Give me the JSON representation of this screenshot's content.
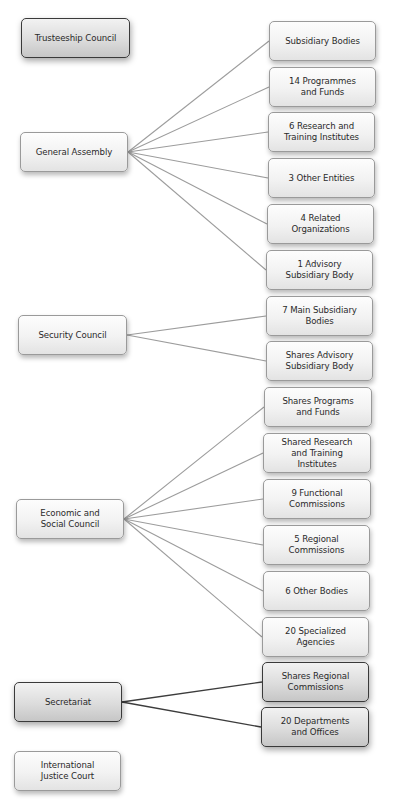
{
  "diagram": {
    "type": "org-chart",
    "left_nodes": [
      {
        "id": "trusteeship",
        "label": "Trusteeship Council",
        "x": 21,
        "y": 18,
        "w": 109,
        "style": "dark"
      },
      {
        "id": "general_assembly",
        "label": "General Assembly",
        "x": 20,
        "y": 132,
        "w": 108,
        "style": "light"
      },
      {
        "id": "security_council",
        "label": "Security Council",
        "x": 18,
        "y": 315,
        "w": 109,
        "style": "light"
      },
      {
        "id": "ecosoc",
        "label": "Economic and\nSocial Council",
        "x": 16,
        "y": 499,
        "w": 108,
        "style": "light"
      },
      {
        "id": "secretariat",
        "label": "Secretariat",
        "x": 14,
        "y": 682,
        "w": 108,
        "style": "dark"
      },
      {
        "id": "icj",
        "label": "International\nJustice Court",
        "x": 14,
        "y": 751,
        "w": 107,
        "style": "light"
      }
    ],
    "right_nodes": [
      {
        "id": "ga_1",
        "parent": "general_assembly",
        "label": "Subsidiary Bodies",
        "x": 269,
        "y": 21,
        "w": 107,
        "style": "light"
      },
      {
        "id": "ga_2",
        "parent": "general_assembly",
        "label": "14 Programmes\nand Funds",
        "x": 269,
        "y": 67,
        "w": 107,
        "style": "light"
      },
      {
        "id": "ga_3",
        "parent": "general_assembly",
        "label": "6 Research and\nTraining Institutes",
        "x": 268,
        "y": 112,
        "w": 107,
        "style": "light"
      },
      {
        "id": "ga_4",
        "parent": "general_assembly",
        "label": "3 Other Entities",
        "x": 268,
        "y": 158,
        "w": 107,
        "style": "light"
      },
      {
        "id": "ga_5",
        "parent": "general_assembly",
        "label": "4 Related\nOrganizations",
        "x": 267,
        "y": 204,
        "w": 107,
        "style": "light"
      },
      {
        "id": "ga_6",
        "parent": "general_assembly",
        "label": "1 Advisory\nSubsidiary Body",
        "x": 266,
        "y": 250,
        "w": 107,
        "style": "light"
      },
      {
        "id": "sc_1",
        "parent": "security_council",
        "label": "7 Main Subsidiary\nBodies",
        "x": 266,
        "y": 296,
        "w": 107,
        "style": "light"
      },
      {
        "id": "sc_2",
        "parent": "security_council",
        "label": "Shares Advisory\nSubsidiary Body",
        "x": 266,
        "y": 341,
        "w": 107,
        "style": "light"
      },
      {
        "id": "es_1",
        "parent": "ecosoc",
        "label": "Shares Programs\nand Funds",
        "x": 264,
        "y": 387,
        "w": 108,
        "style": "light"
      },
      {
        "id": "es_2",
        "parent": "ecosoc",
        "label": "Shared Research\nand Training\nInstitutes",
        "x": 263,
        "y": 433,
        "w": 108,
        "style": "light"
      },
      {
        "id": "es_3",
        "parent": "ecosoc",
        "label": "9 Functional\nCommissions",
        "x": 263,
        "y": 479,
        "w": 108,
        "style": "light"
      },
      {
        "id": "es_4",
        "parent": "ecosoc",
        "label": "5 Regional\nCommissions",
        "x": 263,
        "y": 525,
        "w": 107,
        "style": "light"
      },
      {
        "id": "es_5",
        "parent": "ecosoc",
        "label": "6 Other Bodies",
        "x": 263,
        "y": 571,
        "w": 107,
        "style": "light"
      },
      {
        "id": "es_6",
        "parent": "ecosoc",
        "label": "20 Specialized\nAgencies",
        "x": 262,
        "y": 617,
        "w": 107,
        "style": "light"
      },
      {
        "id": "se_1",
        "parent": "secretariat",
        "label": "Shares Regional\nCommissions",
        "x": 262,
        "y": 662,
        "w": 107,
        "style": "dark"
      },
      {
        "id": "se_2",
        "parent": "secretariat",
        "label": "20 Departments\nand Offices",
        "x": 261,
        "y": 707,
        "w": 108,
        "style": "dark"
      }
    ],
    "link_colors": {
      "light": "#9c9c9c",
      "dark": "#3c3c3c"
    }
  }
}
